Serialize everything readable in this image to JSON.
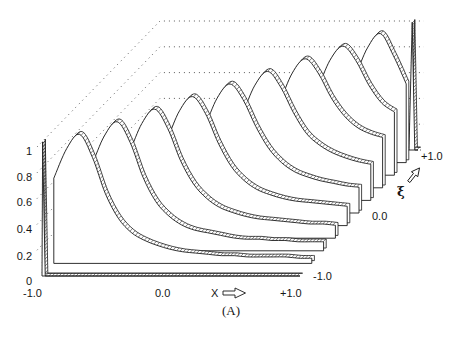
{
  "figure": {
    "caption": "(A)",
    "x_axis_arrow_icon": "hollow-arrow-right",
    "xi_axis_arrow_icon": "hollow-arrow-up-right"
  },
  "chart_data": {
    "type": "line",
    "style": "3d-waterfall",
    "title": "(A)",
    "xlabel": "X",
    "ylabel": "",
    "zlabel": "ξ",
    "xlim": [
      -1.0,
      1.0
    ],
    "ylim": [
      0,
      1
    ],
    "zlim": [
      -1.0,
      1.0
    ],
    "grid": true,
    "grid_style": "dotted back walls",
    "legend": "none",
    "x_tick_labels": [
      "-1.0",
      "0.0",
      "+1.0"
    ],
    "y_tick_labels": [
      "0",
      "0.2",
      "0.4",
      "0.6",
      "0.8",
      "1"
    ],
    "z_tick_labels": [
      "-1.0",
      "0.0",
      "+1.0"
    ],
    "y_ticks": [
      0,
      0.2,
      0.4,
      0.6,
      0.8,
      1.0
    ],
    "x": [
      -1.0,
      -0.9,
      -0.8,
      -0.7,
      -0.6,
      -0.5,
      -0.4,
      -0.3,
      -0.2,
      -0.1,
      0.0,
      0.1,
      0.2,
      0.3,
      0.4,
      0.5,
      0.6,
      0.7,
      0.8,
      0.9,
      1.0
    ],
    "series": [
      {
        "name": "ξ = -1.0",
        "xi": -1.0,
        "points": [
          [
            -1.0,
            0
          ],
          [
            -0.995,
            1.04
          ],
          [
            -0.975,
            0
          ],
          [
            1.0,
            0
          ]
        ]
      },
      {
        "name": "ξ = -0.8",
        "xi": -0.8,
        "values": [
          0.66,
          0.89,
          1.0,
          0.82,
          0.54,
          0.35,
          0.24,
          0.18,
          0.14,
          0.11,
          0.09,
          0.08,
          0.07,
          0.06,
          0.06,
          0.05,
          0.05,
          0.05,
          0.05,
          0.04,
          0.04
        ]
      },
      {
        "name": "ξ = -0.6",
        "xi": -0.6,
        "values": [
          0.33,
          0.47,
          0.66,
          0.89,
          1.0,
          0.84,
          0.57,
          0.38,
          0.27,
          0.2,
          0.16,
          0.14,
          0.12,
          0.1,
          0.09,
          0.09,
          0.08,
          0.08,
          0.07,
          0.07,
          0.07
        ]
      },
      {
        "name": "ξ = -0.4",
        "xi": -0.4,
        "values": [
          0.18,
          0.24,
          0.33,
          0.47,
          0.66,
          0.89,
          1.0,
          0.85,
          0.6,
          0.42,
          0.31,
          0.24,
          0.2,
          0.17,
          0.15,
          0.14,
          0.13,
          0.12,
          0.11,
          0.11,
          0.1
        ]
      },
      {
        "name": "ξ = -0.2",
        "xi": -0.2,
        "values": [
          0.11,
          0.14,
          0.18,
          0.24,
          0.33,
          0.47,
          0.66,
          0.89,
          1.0,
          0.87,
          0.64,
          0.46,
          0.35,
          0.28,
          0.24,
          0.21,
          0.19,
          0.18,
          0.17,
          0.16,
          0.15
        ]
      },
      {
        "name": "ξ = 0.0",
        "xi": 0.0,
        "values": [
          0.07,
          0.09,
          0.11,
          0.14,
          0.18,
          0.24,
          0.33,
          0.47,
          0.66,
          0.89,
          1.0,
          0.88,
          0.67,
          0.5,
          0.39,
          0.32,
          0.28,
          0.25,
          0.23,
          0.21,
          0.2
        ]
      },
      {
        "name": "ξ = 0.2",
        "xi": 0.2,
        "values": [
          0.05,
          0.06,
          0.07,
          0.09,
          0.11,
          0.14,
          0.18,
          0.24,
          0.33,
          0.47,
          0.66,
          0.89,
          1.0,
          0.88,
          0.68,
          0.52,
          0.43,
          0.37,
          0.33,
          0.3,
          0.28
        ]
      },
      {
        "name": "ξ = 0.4",
        "xi": 0.4,
        "values": [
          0.04,
          0.04,
          0.05,
          0.06,
          0.07,
          0.09,
          0.11,
          0.14,
          0.18,
          0.24,
          0.33,
          0.47,
          0.66,
          0.89,
          1.0,
          0.89,
          0.7,
          0.56,
          0.47,
          0.42,
          0.39
        ]
      },
      {
        "name": "ξ = 0.6",
        "xi": 0.6,
        "values": [
          0.03,
          0.03,
          0.04,
          0.04,
          0.05,
          0.06,
          0.07,
          0.09,
          0.11,
          0.14,
          0.18,
          0.24,
          0.33,
          0.47,
          0.66,
          0.89,
          1.0,
          0.89,
          0.7,
          0.56,
          0.49
        ]
      },
      {
        "name": "ξ = 0.8",
        "xi": 0.8,
        "values": [
          0.02,
          0.03,
          0.03,
          0.03,
          0.04,
          0.04,
          0.05,
          0.06,
          0.07,
          0.09,
          0.11,
          0.14,
          0.18,
          0.24,
          0.33,
          0.47,
          0.66,
          0.89,
          1.0,
          0.83,
          0.61
        ]
      },
      {
        "name": "ξ = +1.0",
        "xi": 1.0,
        "points": [
          [
            -1.0,
            0
          ],
          [
            0.93,
            0
          ],
          [
            0.955,
            0.99
          ],
          [
            0.975,
            0
          ],
          [
            1.0,
            0
          ]
        ]
      }
    ]
  }
}
